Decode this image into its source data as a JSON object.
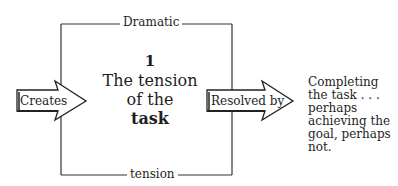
{
  "diagram": {
    "frame": {
      "top_label": "Dramatic",
      "bottom_label": "tension"
    },
    "center": {
      "number": "1",
      "line1": "The tension",
      "line2": "of the",
      "line3": "task"
    },
    "arrows": {
      "input": {
        "label": "Creates",
        "icon": "right-arrow-icon"
      },
      "output": {
        "label": "Resolved by",
        "icon": "right-arrow-icon"
      }
    },
    "outcome": {
      "text": "Completing the task . . . perhaps achieving the goal, perhaps not."
    },
    "colors": {
      "line": "#333333",
      "text": "#1e1e1e",
      "background": "#ffffff"
    }
  }
}
